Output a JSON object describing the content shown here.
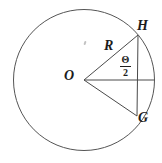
{
  "figure": {
    "labels": {
      "center": "O",
      "top_point": "H",
      "bottom_point": "G",
      "radius": "R",
      "angle_numerator": "Θ",
      "angle_denominator": "2"
    },
    "colors": {
      "background": "#ffffff",
      "circle_stroke": "#555555",
      "line_stroke": "#4a4a4a",
      "text": "#1c1c1c"
    },
    "geometry": {
      "canvas": {
        "width": 162,
        "height": 163
      },
      "center": {
        "x": 84,
        "y": 80
      },
      "radius": 70.5,
      "points": {
        "H": {
          "x": 138,
          "y": 35
        },
        "G": {
          "x": 137,
          "y": 116
        },
        "right_edge": {
          "x": 154,
          "y": 80
        }
      }
    }
  }
}
